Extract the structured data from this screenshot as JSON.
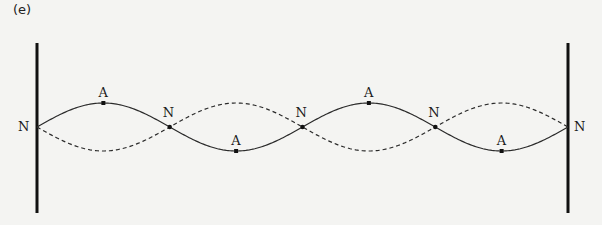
{
  "figure": {
    "part_label": "(e)",
    "node_label": "N",
    "antinode_label": "A",
    "loops": 4,
    "nodes": [
      "N",
      "N",
      "N",
      "N",
      "N"
    ],
    "antinodes": [
      {
        "label": "A",
        "position": "top"
      },
      {
        "label": "A",
        "position": "bottom"
      },
      {
        "label": "A",
        "position": "top"
      },
      {
        "label": "A",
        "position": "bottom"
      }
    ],
    "solid_curve": "displacement at one extreme",
    "dashed_curve": "displacement at opposite extreme",
    "colors": {
      "line": "#2a2a2a",
      "wall": "#111111",
      "background": "#f4f4f2"
    }
  }
}
